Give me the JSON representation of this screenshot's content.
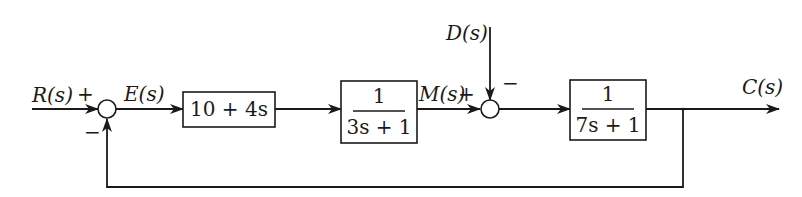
{
  "diagram": {
    "type": "feedback-control-block-diagram",
    "signals": {
      "input": "R(s)",
      "error": "E(s)",
      "intermediate": "M(s)",
      "disturbance": "D(s)",
      "output": "C(s)"
    },
    "blocks": [
      {
        "id": "controller",
        "expr": "10 + 4s"
      },
      {
        "id": "plant1",
        "numerator": "1",
        "denominator": "3s + 1"
      },
      {
        "id": "plant2",
        "numerator": "1",
        "denominator": "7s + 1"
      }
    ],
    "summing_junctions": [
      {
        "id": "sum1",
        "plus_sign": "+",
        "minus_sign": "−"
      },
      {
        "id": "sum2",
        "plus_sign": "+",
        "minus_sign": "−"
      }
    ],
    "colors": {
      "line": "#1a1a1a",
      "background": "#ffffff"
    }
  }
}
